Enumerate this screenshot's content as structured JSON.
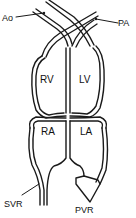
{
  "diagram": {
    "type": "heart circulation schematic",
    "labels": {
      "ao": "Ao",
      "pa": "PA",
      "svr": "SVR",
      "pvr": "PVR"
    },
    "chambers": {
      "rv": "RV",
      "lv": "LV",
      "ra": "RA",
      "la": "LA"
    },
    "colors": {
      "stroke": "#1a1a1a",
      "background": "#ffffff"
    }
  }
}
